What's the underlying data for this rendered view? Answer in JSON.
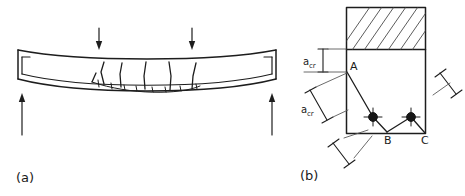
{
  "figure": {
    "background_color": "#ffffff",
    "ink_color": "#1d1d1d",
    "hatch_color": "#4a4a4a"
  },
  "panel_a": {
    "caption": "(a)",
    "description": "Simply supported reinforced concrete beam in four-point bending, deflected downward, showing flexural cracks rising from the tension face and internal reinforcement",
    "loads": [
      {
        "name": "point-load-left",
        "direction": "down",
        "label": ""
      },
      {
        "name": "point-load-right",
        "direction": "down",
        "label": ""
      }
    ],
    "reactions": [
      {
        "name": "support-reaction-left",
        "direction": "up",
        "label": ""
      },
      {
        "name": "support-reaction-right",
        "direction": "up",
        "label": ""
      }
    ],
    "crack_count": 6,
    "tick_count": 8
  },
  "panel_b": {
    "caption": "(b)",
    "description": "Cross-section detail at the tension zone showing crack path A-B-C between two reinforcing bars, with crack distance a_cr measured vertically and along the inclined path",
    "hatched_region_label": "compression-zone-hatching",
    "points": [
      {
        "id": "A",
        "label": "A"
      },
      {
        "id": "B",
        "label": "B"
      },
      {
        "id": "C",
        "label": "C"
      }
    ],
    "dimensions": [
      {
        "id": "acr-vertical",
        "label": "a",
        "subscript": "cr",
        "orientation": "vertical"
      },
      {
        "id": "acr-inclined",
        "label": "a",
        "subscript": "cr",
        "orientation": "inclined"
      }
    ],
    "brackets": [
      {
        "id": "bracket-right",
        "label": ""
      },
      {
        "id": "bracket-bottom-left",
        "label": ""
      }
    ],
    "rebar": [
      {
        "id": "rebar-left",
        "label": ""
      },
      {
        "id": "rebar-right",
        "label": ""
      }
    ]
  }
}
